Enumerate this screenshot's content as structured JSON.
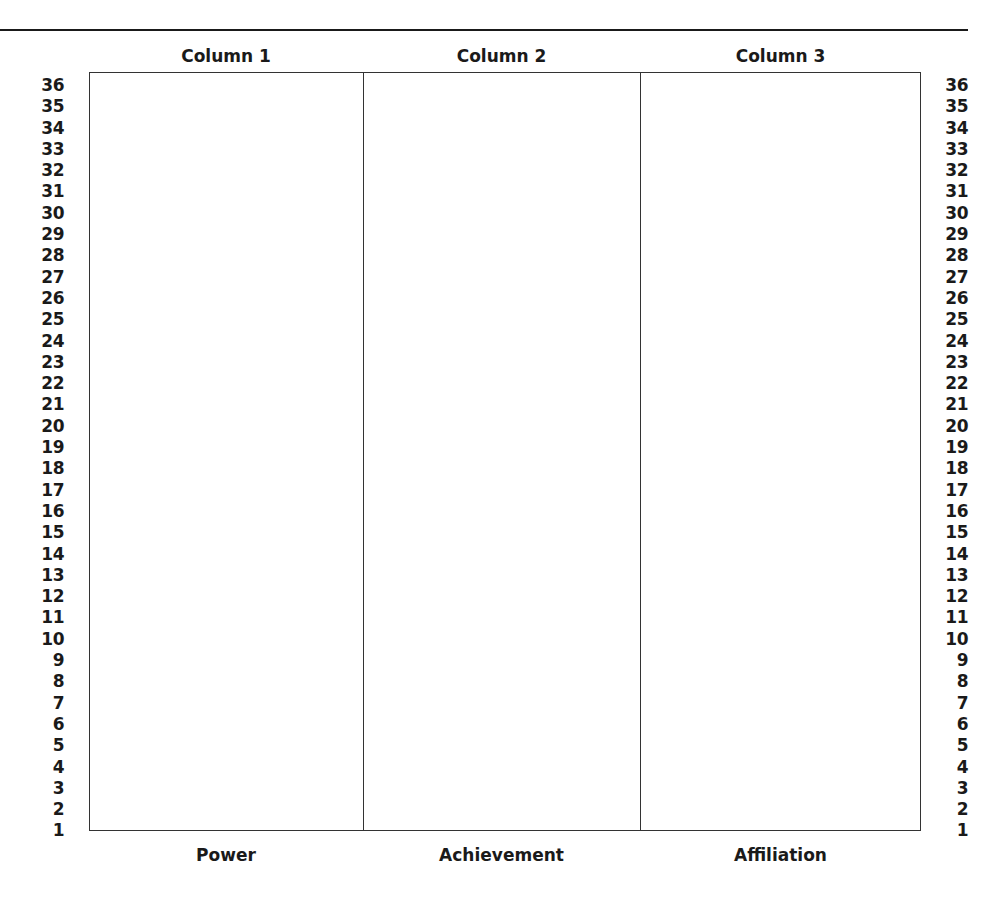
{
  "worksheet": {
    "columns": [
      {
        "header": "Column 1",
        "footer": "Power"
      },
      {
        "header": "Column 2",
        "footer": "Achievement"
      },
      {
        "header": "Column 3",
        "footer": "Affiliation"
      }
    ],
    "scale": {
      "min": 1,
      "max": 36,
      "values": [
        "36",
        "35",
        "34",
        "33",
        "32",
        "31",
        "30",
        "29",
        "28",
        "27",
        "26",
        "25",
        "24",
        "23",
        "22",
        "21",
        "20",
        "19",
        "18",
        "17",
        "16",
        "15",
        "14",
        "13",
        "12",
        "11",
        "10",
        "9",
        "8",
        "7",
        "6",
        "5",
        "4",
        "3",
        "2",
        "1"
      ]
    }
  }
}
